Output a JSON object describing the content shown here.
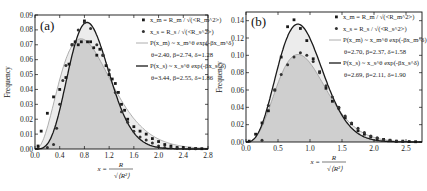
{
  "chart_data": [
    {
      "type": "scatter",
      "panel_label": "(a)",
      "title": "",
      "xlabel": "x = R / sqrt(<R^2>)",
      "ylabel": "Frequency",
      "xlim": [
        0.0,
        2.8
      ],
      "ylim": [
        0.0,
        0.09
      ],
      "xticks": [
        "0.0",
        "0.4",
        "0.8",
        "1.2",
        "1.6",
        "2.0",
        "2.4",
        "2.8"
      ],
      "yticks": [
        "0.00",
        "0.01",
        "0.02",
        "0.03",
        "0.04",
        "0.05",
        "0.06",
        "0.07",
        "0.08",
        "0.09"
      ],
      "grid": false,
      "legend_position": "upper right",
      "legend": [
        "x_m = R_m / sqrt(<R_m^2>)",
        "x_s = R_s / sqrt(<R_s^2>)",
        "P(x_m) ~ x_m^θ exp(-βx_m^δ)",
        "θ=2.40, β=2.74, δ=1.28",
        "P(x_s) ~ x_s^θ exp(-βx_s^δ)",
        "θ=3.44, β=2.55, δ=1.86"
      ],
      "series": [
        {
          "name": "x_m = R_m / sqrt(<R_m^2>)",
          "marker": "square",
          "x": [
            0.05,
            0.1,
            0.2,
            0.3,
            0.4,
            0.5,
            0.55,
            0.6,
            0.65,
            0.7,
            0.75,
            0.8,
            0.85,
            0.9,
            0.95,
            1.0,
            1.05,
            1.1,
            1.15,
            1.2,
            1.25,
            1.3,
            1.35,
            1.4,
            1.45,
            1.5,
            1.6,
            1.7,
            1.8,
            1.9,
            2.0,
            2.1,
            2.2,
            2.3,
            2.4,
            2.5,
            2.6,
            2.7
          ],
          "y": [
            0.002,
            0.012,
            0.024,
            0.035,
            0.04,
            0.048,
            0.057,
            0.07,
            0.072,
            0.07,
            0.072,
            0.086,
            0.072,
            0.072,
            0.068,
            0.063,
            0.067,
            0.063,
            0.056,
            0.05,
            0.047,
            0.044,
            0.038,
            0.03,
            0.026,
            0.02,
            0.015,
            0.012,
            0.01,
            0.007,
            0.005,
            0.003,
            0.002,
            0.001,
            0.001,
            0.0005,
            0.0003,
            0.0002
          ]
        },
        {
          "name": "x_s = R_s / sqrt(<R_s^2>)",
          "marker": "circle",
          "x": [
            0.05,
            0.2,
            0.3,
            0.35,
            0.4,
            0.45,
            0.5,
            0.6,
            0.7,
            0.8,
            0.9,
            1.0,
            1.1,
            1.2,
            1.3,
            1.4,
            1.5,
            1.6,
            1.7,
            1.8,
            1.9,
            2.0,
            2.1,
            2.2,
            2.3,
            2.4,
            2.5,
            2.6
          ],
          "y": [
            0.0005,
            0.001,
            0.003,
            0.014,
            0.03,
            0.046,
            0.056,
            0.07,
            0.08,
            0.085,
            0.081,
            0.07,
            0.063,
            0.053,
            0.038,
            0.025,
            0.018,
            0.012,
            0.008,
            0.006,
            0.004,
            0.002,
            0.001,
            0.0008,
            0.0005,
            0.0003,
            0.0002,
            0.0001
          ]
        },
        {
          "name": "P(x_m) ~ x_m^θ exp(-βx_m^δ)",
          "style": "thin light line",
          "params": {
            "theta": 2.4,
            "beta": 2.74,
            "delta": 1.28
          },
          "x": [
            0.0,
            0.2,
            0.4,
            0.6,
            0.8,
            1.0,
            1.2,
            1.4,
            1.6,
            1.8,
            2.0,
            2.2,
            2.4,
            2.6,
            2.8
          ],
          "y": [
            0.0,
            0.011,
            0.039,
            0.064,
            0.074,
            0.07,
            0.057,
            0.041,
            0.027,
            0.016,
            0.009,
            0.005,
            0.003,
            0.001,
            0.0005
          ]
        },
        {
          "name": "P(x_s) ~ x_s^θ exp(-βx_s^δ)",
          "style": "thick dark line",
          "params": {
            "theta": 3.44,
            "beta": 2.55,
            "delta": 1.86
          },
          "x": [
            0.0,
            0.2,
            0.4,
            0.6,
            0.8,
            1.0,
            1.2,
            1.4,
            1.6,
            1.8,
            2.0,
            2.2,
            2.4,
            2.6,
            2.8
          ],
          "y": [
            0.0,
            0.002,
            0.022,
            0.061,
            0.085,
            0.079,
            0.055,
            0.03,
            0.013,
            0.005,
            0.0015,
            0.0004,
            0.0001,
            0.0,
            0.0
          ]
        }
      ]
    },
    {
      "type": "scatter",
      "panel_label": "(b)",
      "title": "",
      "xlabel": "x = R / sqrt(<R^2>)",
      "ylabel": "Frequency",
      "xlim": [
        0.0,
        2.75
      ],
      "ylim": [
        0.0,
        0.15
      ],
      "xticks": [
        "0.0",
        "0.5",
        "1.0",
        "1.5",
        "2.0",
        "2.5"
      ],
      "yticks": [
        "0.00",
        "0.02",
        "0.04",
        "0.06",
        "0.08",
        "0.10",
        "0.12",
        "0.14"
      ],
      "grid": false,
      "legend_position": "upper right",
      "legend": [
        "x_m = R_m / sqrt(<R_m^2>)",
        "x_s = R_s / sqrt(<R_s^2>)",
        "P(x_m) ~ x_m^θ exp(-βx_m^δ)",
        "θ=2.70, β=2.37, δ=1.58",
        "P(x_s) ~ x_s^θ exp(-βx_s^δ)",
        "θ=2.69, β=2.11, δ=1.90"
      ],
      "series": [
        {
          "name": "x_m = R_m / sqrt(<R_m^2>)",
          "marker": "square",
          "x": [
            0.05,
            0.15,
            0.25,
            0.35,
            0.45,
            0.55,
            0.65,
            0.75,
            0.85,
            0.95,
            1.05,
            1.15,
            1.25,
            1.35,
            1.45,
            1.55,
            1.65,
            1.75,
            1.85,
            1.95,
            2.05,
            2.15,
            2.25,
            2.35,
            2.45,
            2.55,
            2.65
          ],
          "y": [
            0.001,
            0.009,
            0.022,
            0.036,
            0.06,
            0.098,
            0.133,
            0.141,
            0.131,
            0.117,
            0.096,
            0.081,
            0.062,
            0.047,
            0.039,
            0.028,
            0.021,
            0.013,
            0.009,
            0.006,
            0.004,
            0.003,
            0.002,
            0.001,
            0.001,
            0.0005,
            0.0003
          ]
        },
        {
          "name": "x_s = R_s / sqrt(<R_s^2>)",
          "marker": "circle",
          "x": [
            0.25,
            0.35,
            0.45,
            0.55,
            0.65,
            0.75,
            0.85,
            0.95,
            1.05,
            1.15,
            1.25,
            1.35,
            1.45,
            1.55,
            1.65,
            1.75,
            1.85,
            1.95,
            2.05,
            2.15,
            2.25,
            2.35,
            2.45
          ],
          "y": [
            0.002,
            0.042,
            0.06,
            0.078,
            0.089,
            0.098,
            0.103,
            0.1,
            0.093,
            0.08,
            0.065,
            0.052,
            0.04,
            0.03,
            0.022,
            0.016,
            0.011,
            0.007,
            0.005,
            0.003,
            0.002,
            0.001,
            0.0005
          ]
        },
        {
          "name": "P(x_m) ~ x_m^θ exp(-βx_m^δ)",
          "style": "thin light line",
          "params": {
            "theta": 2.7,
            "beta": 2.37,
            "delta": 1.58
          },
          "x": [
            0.0,
            0.25,
            0.5,
            0.75,
            1.0,
            1.25,
            1.5,
            1.75,
            2.0,
            2.25,
            2.5,
            2.75
          ],
          "y": [
            0.0,
            0.014,
            0.066,
            0.101,
            0.093,
            0.062,
            0.032,
            0.014,
            0.005,
            0.002,
            0.0006,
            0.0002
          ]
        },
        {
          "name": "P(x_s) ~ x_s^θ exp(-βx_s^δ)",
          "style": "thick dark line",
          "params": {
            "theta": 2.69,
            "beta": 2.11,
            "delta": 1.9
          },
          "x": [
            0.0,
            0.25,
            0.5,
            0.75,
            1.0,
            1.25,
            1.5,
            1.75,
            2.0,
            2.25,
            2.5,
            2.75
          ],
          "y": [
            0.0,
            0.015,
            0.085,
            0.136,
            0.118,
            0.07,
            0.03,
            0.01,
            0.003,
            0.0007,
            0.0001,
            0.0
          ]
        }
      ]
    }
  ]
}
